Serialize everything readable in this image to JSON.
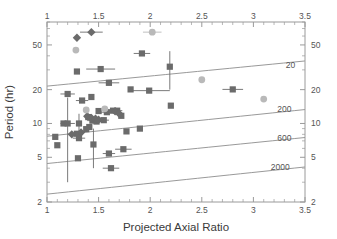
{
  "figure": {
    "background": "#ffffff",
    "plot_frame_color": "#9a9a9a",
    "text_color": "#555555"
  },
  "axes": {
    "x_title": "Projected Axial Ratio",
    "y_title": "Period (hr)",
    "x_ticks_bottom": [
      "1",
      "1.5",
      "2",
      "2.5",
      "3",
      "3.5"
    ],
    "x_ticks_top": [
      "1",
      "1.5",
      "2",
      "2.5",
      "3",
      "3.5"
    ],
    "y_ticks_left": [
      "50",
      "20",
      "10",
      "5",
      "2"
    ],
    "y_ticks_right": [
      "50",
      "20",
      "10",
      "5",
      "2"
    ]
  },
  "chart_data": {
    "type": "scatter",
    "title": "",
    "xlabel": "Projected Axial Ratio",
    "ylabel": "Period (hr)",
    "xlim": [
      1,
      3.5
    ],
    "ylim": [
      2,
      80
    ],
    "xscale": "linear",
    "yscale": "log",
    "grid": false,
    "legend": "none",
    "annotations": [
      {
        "text": "20",
        "x": 3.36,
        "y": 31.0
      },
      {
        "text": "200",
        "x": 3.3,
        "y": 12.6
      },
      {
        "text": "600",
        "x": 3.3,
        "y": 7.0
      },
      {
        "text": "2000",
        "x": 3.26,
        "y": 3.85
      }
    ],
    "curves": [
      {
        "name": "density-20",
        "x": [
          1.0,
          3.5
        ],
        "y": [
          21.5,
          36.0
        ]
      },
      {
        "name": "density-200",
        "x": [
          1.0,
          3.5
        ],
        "y": [
          7.7,
          13.3
        ]
      },
      {
        "name": "density-600",
        "x": [
          1.0,
          3.5
        ],
        "y": [
          4.4,
          7.5
        ]
      },
      {
        "name": "density-2000",
        "x": [
          1.0,
          3.5
        ],
        "y": [
          2.35,
          4.1
        ]
      }
    ],
    "series": [
      {
        "name": "dark-squares",
        "marker": "square",
        "color": "#6b6b6b",
        "points": [
          {
            "x": 1.08,
            "y": 7.6,
            "xerr": 0.0,
            "yerr": 0.0
          },
          {
            "x": 1.1,
            "y": 6.4,
            "xerr": 0.0,
            "yerr": 0.0
          },
          {
            "x": 1.16,
            "y": 10.0,
            "xerr": 0.0,
            "yerr": 0.0
          },
          {
            "x": 1.2,
            "y": 18.3,
            "xerr": 0.07,
            "yerr": 0.0
          },
          {
            "x": 1.2,
            "y": 10.0,
            "xerr": 0.07,
            "yerr": 7.0
          },
          {
            "x": 1.29,
            "y": 29.0,
            "xerr": 0.0,
            "yerr": 0.0
          },
          {
            "x": 1.29,
            "y": 8.1,
            "xerr": 0.06,
            "yerr": 0.0
          },
          {
            "x": 1.3,
            "y": 4.9,
            "xerr": 0.0,
            "yerr": 0.0
          },
          {
            "x": 1.31,
            "y": 10.0,
            "xerr": 0.0,
            "yerr": 2.2
          },
          {
            "x": 1.31,
            "y": 7.4,
            "xerr": 0.06,
            "yerr": 0.0
          },
          {
            "x": 1.34,
            "y": 16.0,
            "xerr": 0.06,
            "yerr": 0.0
          },
          {
            "x": 1.38,
            "y": 8.9,
            "xerr": 0.0,
            "yerr": 0.0
          },
          {
            "x": 1.4,
            "y": 11.4,
            "xerr": 0.0,
            "yerr": 0.0
          },
          {
            "x": 1.41,
            "y": 9.3,
            "xerr": 0.0,
            "yerr": 0.0
          },
          {
            "x": 1.43,
            "y": 17.2,
            "xerr": 0.0,
            "yerr": 0.0
          },
          {
            "x": 1.44,
            "y": 10.6,
            "xerr": 0.05,
            "yerr": 0.0
          },
          {
            "x": 1.45,
            "y": 6.5,
            "xerr": 0.0,
            "yerr": 2.5
          },
          {
            "x": 1.48,
            "y": 10.4,
            "xerr": 0.05,
            "yerr": 0.0
          },
          {
            "x": 1.5,
            "y": 12.9,
            "xerr": 0.0,
            "yerr": 0.0
          },
          {
            "x": 1.52,
            "y": 30.5,
            "xerr": 0.14,
            "yerr": 0.0
          },
          {
            "x": 1.55,
            "y": 10.7,
            "xerr": 0.05,
            "yerr": 0.0
          },
          {
            "x": 1.58,
            "y": 12.6,
            "xerr": 0.06,
            "yerr": 0.0
          },
          {
            "x": 1.6,
            "y": 23.0,
            "xerr": 0.1,
            "yerr": 0.0
          },
          {
            "x": 1.6,
            "y": 5.4,
            "xerr": 0.06,
            "yerr": 0.0
          },
          {
            "x": 1.62,
            "y": 4.0,
            "xerr": 0.08,
            "yerr": 0.0
          },
          {
            "x": 1.64,
            "y": 13.0,
            "xerr": 0.05,
            "yerr": 0.0
          },
          {
            "x": 1.68,
            "y": 13.0,
            "xerr": 0.05,
            "yerr": 0.0
          },
          {
            "x": 1.72,
            "y": 11.7,
            "xerr": 0.0,
            "yerr": 0.0
          },
          {
            "x": 1.74,
            "y": 5.9,
            "xerr": 0.08,
            "yerr": 0.0
          },
          {
            "x": 1.77,
            "y": 8.5,
            "xerr": 0.0,
            "yerr": 0.0
          },
          {
            "x": 1.81,
            "y": 20.1,
            "xerr": 0.0,
            "yerr": 0.0
          },
          {
            "x": 1.9,
            "y": 9.0,
            "xerr": 0.0,
            "yerr": 0.0
          },
          {
            "x": 1.92,
            "y": 42.0,
            "xerr": 0.08,
            "yerr": 0.0
          },
          {
            "x": 1.99,
            "y": 19.6,
            "xerr": 0.2,
            "yerr": 0.0
          },
          {
            "x": 2.19,
            "y": 32.0,
            "xerr": 0.0,
            "yerr": 12.0
          },
          {
            "x": 2.2,
            "y": 14.4,
            "xerr": 0.0,
            "yerr": 0.0
          },
          {
            "x": 2.8,
            "y": 20.1,
            "xerr": 0.1,
            "yerr": 0.0
          }
        ]
      },
      {
        "name": "dark-diamonds",
        "marker": "diamond",
        "color": "#6b6b6b",
        "points": [
          {
            "x": 1.29,
            "y": 58.0,
            "xerr": 0.0,
            "yerr": 0.0
          },
          {
            "x": 1.43,
            "y": 65.0,
            "xerr": 0.11,
            "yerr": 0.0
          },
          {
            "x": 1.39,
            "y": 11.6,
            "xerr": 0.0,
            "yerr": 0.0
          },
          {
            "x": 1.43,
            "y": 11.2,
            "xerr": 0.0,
            "yerr": 0.0
          },
          {
            "x": 1.47,
            "y": 11.0,
            "xerr": 0.0,
            "yerr": 0.0
          },
          {
            "x": 1.5,
            "y": 10.8,
            "xerr": 0.0,
            "yerr": 0.0
          },
          {
            "x": 1.24,
            "y": 8.0,
            "xerr": 0.0,
            "yerr": 0.0
          },
          {
            "x": 1.33,
            "y": 8.3,
            "xerr": 0.0,
            "yerr": 0.0
          },
          {
            "x": 1.66,
            "y": 12.8,
            "xerr": 0.0,
            "yerr": 0.0
          },
          {
            "x": 1.7,
            "y": 12.2,
            "xerr": 0.0,
            "yerr": 0.0
          }
        ]
      },
      {
        "name": "light-circles",
        "marker": "circle",
        "color": "#b9b9b9",
        "points": [
          {
            "x": 1.28,
            "y": 45.0,
            "xerr": 0.0,
            "yerr": 0.0
          },
          {
            "x": 2.02,
            "y": 65.0,
            "xerr": 0.09,
            "yerr": 0.0
          },
          {
            "x": 1.38,
            "y": 13.2,
            "xerr": 0.0,
            "yerr": 0.0
          },
          {
            "x": 1.56,
            "y": 13.5,
            "xerr": 0.0,
            "yerr": 0.0
          },
          {
            "x": 2.5,
            "y": 24.5,
            "xerr": 0.0,
            "yerr": 0.0
          },
          {
            "x": 3.1,
            "y": 16.5,
            "xerr": 0.0,
            "yerr": 0.0
          }
        ]
      }
    ]
  }
}
